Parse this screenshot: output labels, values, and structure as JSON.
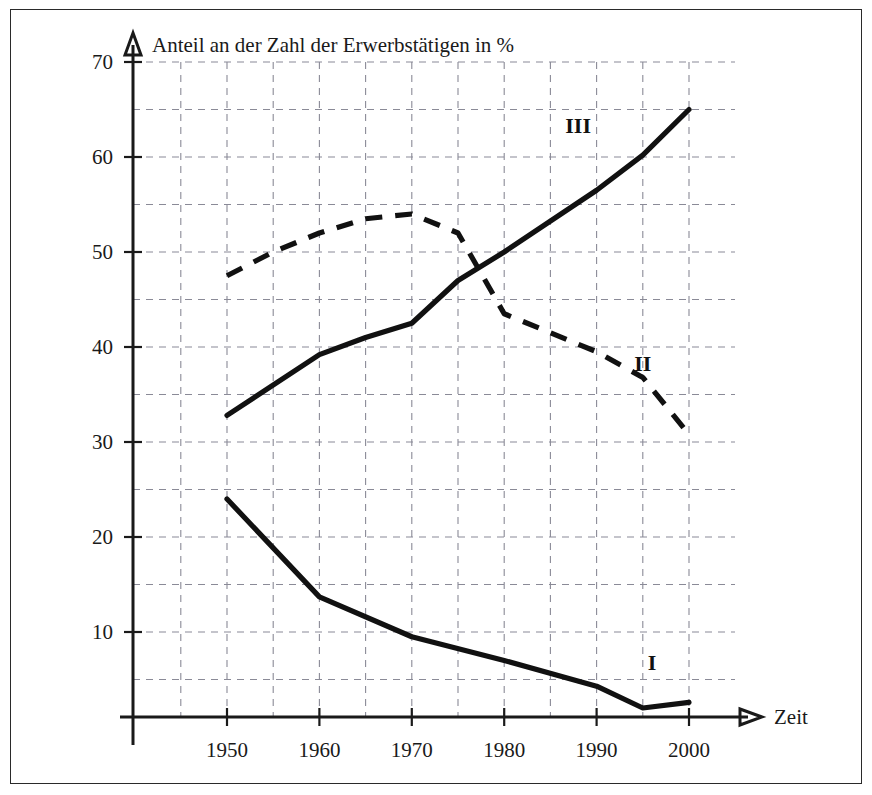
{
  "chart_data": {
    "type": "line",
    "title": "Anteil an der Zahl der Erwerbstätigen in %",
    "xlabel": "Zeit",
    "ylabel": "",
    "xlim": [
      1943,
      2008
    ],
    "ylim": [
      0,
      72
    ],
    "xticks": [
      "1950",
      "1960",
      "1970",
      "1980",
      "1990",
      "2000"
    ],
    "xtick_values": [
      1950,
      1960,
      1970,
      1980,
      1990,
      2000
    ],
    "yticks": [
      "10",
      "20",
      "30",
      "40",
      "50",
      "60",
      "70"
    ],
    "ytick_values": [
      10,
      20,
      30,
      40,
      50,
      60,
      70
    ],
    "grid": true,
    "grid_x_step": 5,
    "grid_y_step": 5,
    "legend_position": "inline-labels",
    "series": [
      {
        "name": "I",
        "label": "I",
        "style": "solid",
        "color": "#111111",
        "label_x": 1996,
        "label_y": 6.0,
        "x": [
          1950,
          1960,
          1970,
          1980,
          1990,
          1995,
          2000
        ],
        "values": [
          24.0,
          13.7,
          9.5,
          7.0,
          4.3,
          2.0,
          2.6
        ]
      },
      {
        "name": "II",
        "label": "II",
        "style": "dashed",
        "color": "#111111",
        "label_x": 1995,
        "label_y": 37.5,
        "x": [
          1950,
          1955,
          1960,
          1965,
          1970,
          1975,
          1980,
          1985,
          1990,
          1995,
          2000
        ],
        "values": [
          47.5,
          50.0,
          52.0,
          53.5,
          54.0,
          52.0,
          43.5,
          41.5,
          39.5,
          36.8,
          30.8
        ]
      },
      {
        "name": "III",
        "label": "III",
        "style": "solid",
        "color": "#111111",
        "label_x": 1988,
        "label_y": 62.5,
        "x": [
          1950,
          1960,
          1965,
          1970,
          1975,
          1980,
          1990,
          1995,
          2000
        ],
        "values": [
          32.8,
          39.2,
          41.0,
          42.5,
          47.0,
          50.0,
          56.5,
          60.2,
          65.0
        ]
      }
    ]
  },
  "axes": {
    "y_axis_name": "vertical-axis",
    "x_axis_name": "horizontal-axis",
    "x_axis_label": "Zeit"
  }
}
